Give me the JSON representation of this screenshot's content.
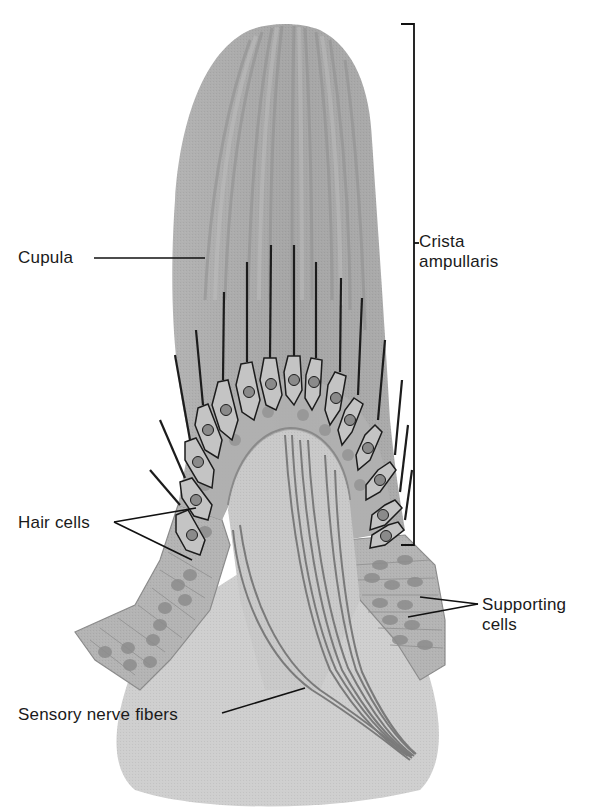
{
  "figure": {
    "colors": {
      "background": "#ffffff",
      "cupula_fill": "#a9a9a9",
      "cupula_streak_dark": "#8e8e8e",
      "cupula_streak_light": "#bdbdbd",
      "epithelium_fill": "#b4b4b4",
      "base_tissue_fill": "#cfcfcf",
      "nucleus_fill": "#8a8a8a",
      "hair_line": "#1c1c1c",
      "nerve_fiber": "#7a7a7a",
      "leader_line": "#111111",
      "label_text": "#1a1a1a"
    }
  },
  "labels": {
    "cupula": "Cupula",
    "crista": {
      "line1": "Crista",
      "line2": "ampullaris"
    },
    "hair_cells": "Hair cells",
    "supporting": {
      "line1": "Supporting",
      "line2": "cells"
    },
    "sensory_nerve": "Sensory nerve fibers"
  }
}
